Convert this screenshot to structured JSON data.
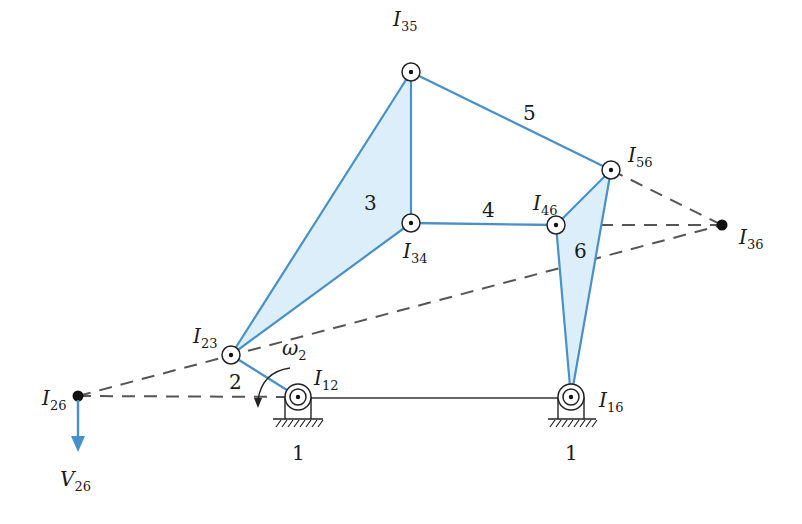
{
  "colors": {
    "link": "#4a90c8",
    "link_fill": "#dceef9",
    "dashed": "#555555",
    "ground_line": "#333333",
    "text": "#1a1a1a",
    "velocity_arrow": "#4a90c8"
  },
  "links": [
    {
      "id": "2",
      "label": "2"
    },
    {
      "id": "3",
      "label": "3"
    },
    {
      "id": "4",
      "label": "4"
    },
    {
      "id": "5",
      "label": "5"
    },
    {
      "id": "6",
      "label": "6"
    }
  ],
  "ground_labels": [
    "1",
    "1"
  ],
  "instant_centers": {
    "I12": {
      "main": "I",
      "sub": "12"
    },
    "I16": {
      "main": "I",
      "sub": "16"
    },
    "I23": {
      "main": "I",
      "sub": "23"
    },
    "I34": {
      "main": "I",
      "sub": "34"
    },
    "I35": {
      "main": "I",
      "sub": "35"
    },
    "I46": {
      "main": "I",
      "sub": "46"
    },
    "I56": {
      "main": "I",
      "sub": "56"
    },
    "I36": {
      "main": "I",
      "sub": "36"
    },
    "I26": {
      "main": "I",
      "sub": "26"
    }
  },
  "angular_velocity": {
    "main": "ω",
    "sub": "2"
  },
  "velocity": {
    "main": "V",
    "sub": "26"
  }
}
